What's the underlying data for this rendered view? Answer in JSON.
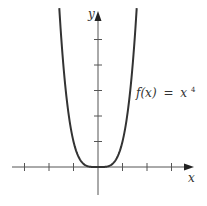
{
  "chart_data": {
    "type": "line",
    "title": "",
    "function_label": "f(x) = x⁴",
    "function_label_parts": {
      "lhs": "f(x)",
      "eq": "=",
      "base": "x",
      "exp": "4"
    },
    "xlabel": "x",
    "ylabel": "y",
    "x_ticks": [
      -3,
      -2,
      -1,
      1,
      2,
      3
    ],
    "y_ticks": [
      1,
      2,
      3,
      4,
      5
    ],
    "xlim": [
      -4,
      4
    ],
    "ylim": [
      -3,
      6.3
    ],
    "grid": false,
    "series": [
      {
        "name": "f(x) = x^4",
        "x": [
          -1.58,
          -1.5,
          -1.25,
          -1,
          -0.75,
          -0.5,
          -0.25,
          0,
          0.25,
          0.5,
          0.75,
          1,
          1.25,
          1.5,
          1.58
        ],
        "values": [
          6.23,
          5.06,
          2.44,
          1,
          0.32,
          0.06,
          0.004,
          0,
          0.004,
          0.06,
          0.32,
          1,
          2.44,
          5.06,
          6.23
        ]
      }
    ],
    "colors": {
      "curve": "#333333",
      "axes": "#555555"
    }
  }
}
